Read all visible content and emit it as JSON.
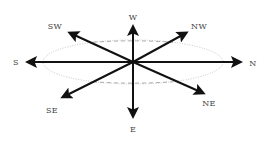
{
  "diagram": {
    "type": "compass-rose",
    "center": [
      133,
      62
    ],
    "colors": {
      "arrow": "#111111",
      "ellipse": "#b8b8b8",
      "label": "#444444",
      "background": "#ffffff"
    },
    "ellipse": {
      "cx": 133,
      "cy": 62,
      "rx": 90,
      "ry": 22
    },
    "directions": [
      {
        "id": "w",
        "label": "W",
        "tip": [
          133,
          27
        ],
        "label_pos": [
          133,
          17
        ]
      },
      {
        "id": "e",
        "label": "E",
        "tip": [
          133,
          116
        ],
        "label_pos": [
          133,
          129
        ]
      },
      {
        "id": "s",
        "label": "S",
        "tip": [
          28,
          62
        ],
        "label_pos": [
          16,
          62
        ]
      },
      {
        "id": "n",
        "label": "N",
        "tip": [
          240,
          62
        ],
        "label_pos": [
          253,
          63
        ]
      },
      {
        "id": "sw",
        "label": "SW",
        "tip": [
          70,
          33
        ],
        "label_pos": [
          55,
          26
        ]
      },
      {
        "id": "nw",
        "label": "NW",
        "tip": [
          186,
          33
        ],
        "label_pos": [
          199,
          26
        ]
      },
      {
        "id": "se",
        "label": "SE",
        "tip": [
          63,
          97
        ],
        "label_pos": [
          52,
          110
        ]
      },
      {
        "id": "ne",
        "label": "NE",
        "tip": [
          203,
          93
        ],
        "label_pos": [
          209,
          103
        ]
      }
    ]
  }
}
